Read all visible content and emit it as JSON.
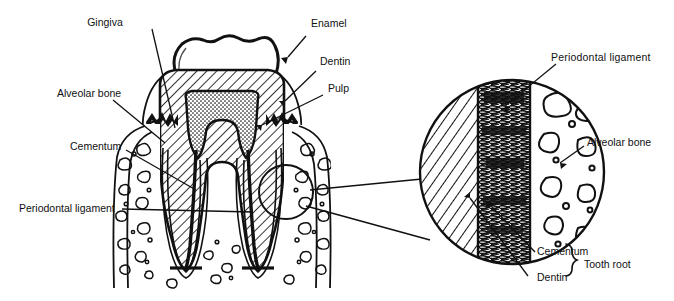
{
  "diagram": {
    "background_color": "#ffffff",
    "ink_color": "#111111",
    "labels": {
      "gingiva": "Gingiva",
      "alveolar_bone_left": "Alveolar bone",
      "cementum_left": "Cementum",
      "periodontal_ligament_left": "Periodontal ligament",
      "enamel": "Enamel",
      "dentin_top": "Dentin",
      "pulp": "Pulp",
      "periodontal_ligament_right": "Periodontal  ligament",
      "alveolar_bone_right": "Alveolar bone",
      "cementum_inset": "Cementum",
      "dentin_inset": "Dentin",
      "tooth_root": "Tooth root"
    },
    "structures": {
      "crown": "enamel-cap",
      "dentin_fill": "diagonal-hatch",
      "pulp_fill": "stipple",
      "ligament_fill": "dense-fibers",
      "bone_fill": "trabecular-blobs"
    },
    "inset": {
      "shape": "circle",
      "bands": [
        "dentin",
        "periodontal-ligament",
        "alveolar-bone"
      ]
    }
  }
}
